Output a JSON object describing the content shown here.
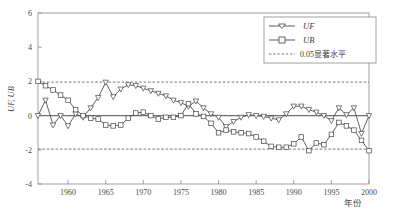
{
  "chart_data": {
    "type": "line",
    "title": "",
    "xlabel": "年份",
    "ylabel": "UF, UB",
    "xlim": [
      1956,
      2000
    ],
    "ylim": [
      -4,
      6
    ],
    "xticks": [
      1960,
      1965,
      1970,
      1975,
      1980,
      1985,
      1990,
      1995,
      2000
    ],
    "yticks": [
      6,
      4,
      2,
      0,
      -2,
      -4
    ],
    "grid": false,
    "legend_position": "top-right",
    "legend": [
      "UF",
      "UB",
      "0.05显著水平"
    ],
    "annotations": [
      {
        "text": "0.05显著水平",
        "type": "threshold-line",
        "values": [
          1.96,
          -1.96
        ]
      }
    ],
    "threshold_lines": [
      1.96,
      -1.96
    ],
    "zero_line": 0,
    "x": [
      1956,
      1957,
      1958,
      1959,
      1960,
      1961,
      1962,
      1963,
      1964,
      1965,
      1966,
      1967,
      1968,
      1969,
      1970,
      1971,
      1972,
      1973,
      1974,
      1975,
      1976,
      1977,
      1978,
      1979,
      1980,
      1981,
      1982,
      1983,
      1984,
      1985,
      1986,
      1987,
      1988,
      1989,
      1990,
      1991,
      1992,
      1993,
      1994,
      1995,
      1996,
      1997,
      1998,
      1999,
      2000
    ],
    "series": [
      {
        "name": "UF",
        "marker": "triangle-down",
        "values": [
          0.0,
          0.9,
          -0.55,
          0.0,
          -0.6,
          0.1,
          -0.1,
          0.45,
          1.05,
          1.95,
          1.1,
          1.55,
          1.8,
          1.75,
          1.6,
          1.45,
          1.3,
          1.15,
          0.9,
          0.75,
          0.55,
          0.85,
          0.45,
          0.1,
          -0.1,
          -0.65,
          -0.35,
          -0.1,
          0.05,
          0.0,
          -0.05,
          -0.15,
          -0.25,
          0.1,
          0.55,
          0.55,
          0.35,
          0.2,
          0.0,
          -0.3,
          0.45,
          0.05,
          0.45,
          -1.05,
          0.0
        ]
      },
      {
        "name": "UB",
        "marker": "square",
        "values": [
          2.0,
          1.75,
          1.5,
          1.2,
          0.9,
          0.35,
          0.0,
          -0.15,
          -0.2,
          -0.55,
          -0.6,
          -0.55,
          -0.15,
          0.15,
          0.2,
          0.0,
          -0.2,
          -0.1,
          -0.1,
          0.0,
          0.7,
          0.1,
          -0.05,
          -0.45,
          -1.0,
          -0.85,
          -0.95,
          -1.0,
          -1.05,
          -1.25,
          -1.5,
          -1.8,
          -1.85,
          -1.85,
          -1.65,
          -1.25,
          -2.05,
          -1.6,
          -1.7,
          -1.1,
          -0.4,
          -0.6,
          -0.85,
          -1.45,
          -2.05
        ]
      }
    ]
  },
  "axes": {
    "y_ticks_labels": [
      "6",
      "4",
      "2",
      "0",
      "-2",
      "-4"
    ],
    "x_ticks_labels": [
      "1960",
      "1965",
      "1970",
      "1975",
      "1980",
      "1985",
      "1990",
      "1995",
      "2000"
    ],
    "x_axis_title": "年份",
    "y_axis_title": "UF, UB"
  },
  "legend": {
    "items": [
      {
        "label": "UF",
        "marker": "triangle-down-icon",
        "style": "solid"
      },
      {
        "label": "UB",
        "marker": "square-icon",
        "style": "solid"
      },
      {
        "label": "0.05显著水平",
        "marker": "none",
        "style": "dashed"
      }
    ]
  },
  "colors": {
    "line": "#444444",
    "axis": "#777777",
    "text": "#3a3a3a",
    "background": "#ffffff"
  }
}
